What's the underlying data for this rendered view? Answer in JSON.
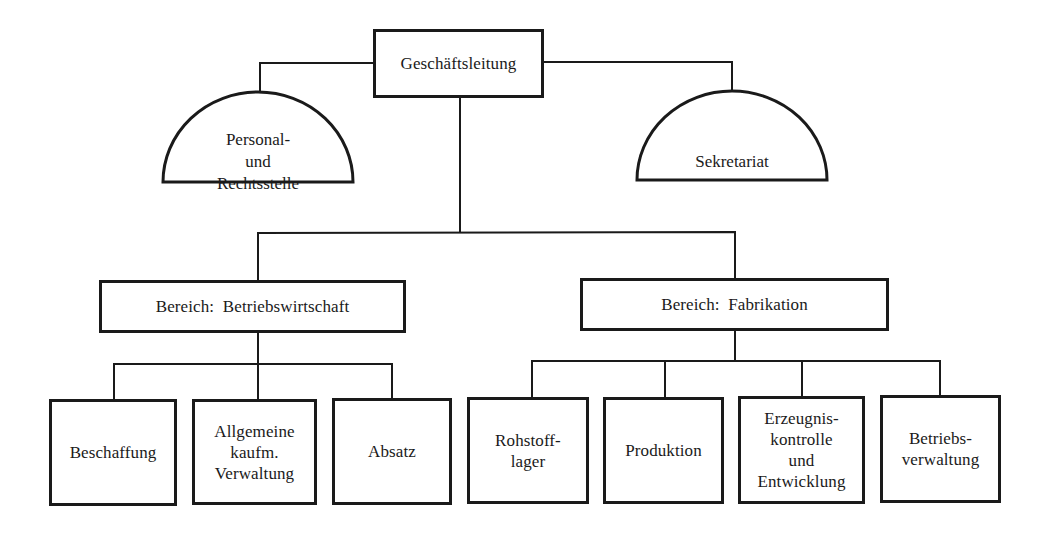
{
  "diagram": {
    "type": "organizational-chart",
    "colors": {
      "line": "#1a1a1a",
      "background": "#ffffff"
    },
    "root": {
      "label": "Geschäftsleitung"
    },
    "staff": [
      {
        "label": "Personal-\nund\nRechtsstelle",
        "shape": "half-circle",
        "side": "left"
      },
      {
        "label": "Sekretariat",
        "shape": "half-circle",
        "side": "right"
      }
    ],
    "divisions": [
      {
        "label": "Bereich:  Betriebswirtschaft",
        "departments": [
          {
            "label": "Beschaffung"
          },
          {
            "label": "Allgemeine\nkaufm.\nVerwaltung"
          },
          {
            "label": "Absatz"
          }
        ]
      },
      {
        "label": "Bereich:  Fabrikation",
        "departments": [
          {
            "label": "Rohstoff-\nlager"
          },
          {
            "label": "Produktion"
          },
          {
            "label": "Erzeugnis-\nkontrolle\nund\nEntwicklung"
          },
          {
            "label": "Betriebs-\nverwaltung"
          }
        ]
      }
    ]
  }
}
